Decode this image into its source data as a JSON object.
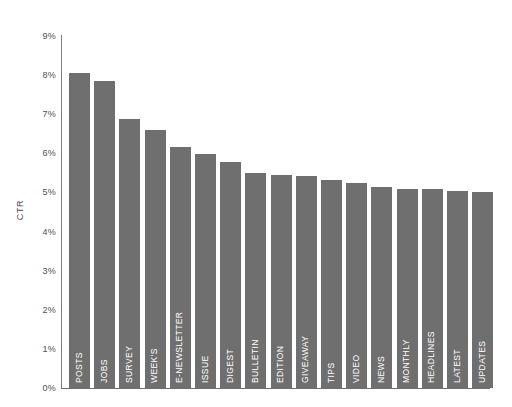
{
  "chart_data": {
    "type": "bar",
    "title": "",
    "subtitle": "",
    "xlabel": "",
    "ylabel": "CTR",
    "ylim": [
      0,
      9
    ],
    "grid": false,
    "legend": false,
    "legend_position": "none",
    "y_tick_labels": [
      "9%",
      "8%",
      "7%",
      "6%",
      "5%",
      "4%",
      "3%",
      "2%",
      "1%",
      "0%"
    ],
    "y_tick_values": [
      9,
      8,
      7,
      6,
      5,
      4,
      3,
      2,
      1,
      0
    ],
    "value_suffix": "%",
    "bar_color": "#706F6F",
    "axis_color": "#7D7D7D",
    "background_color": "#FFFFFF",
    "label_color": "#FFFFFF",
    "categories": [
      "POSTS",
      "JOBS",
      "SURVEY",
      "WEEK'S",
      "E-NEWSLETTER",
      "ISSUE",
      "DIGEST",
      "BULLETIN",
      "EDITION",
      "GIVEAWAY",
      "TIPS",
      "VIDEO",
      "NEWS",
      "MONTHLY",
      "HEADLINES",
      "LATEST",
      "UPDATES"
    ],
    "values": [
      8.05,
      7.85,
      6.88,
      6.6,
      6.15,
      5.98,
      5.78,
      5.5,
      5.45,
      5.42,
      5.32,
      5.25,
      5.15,
      5.1,
      5.08,
      5.05,
      5.02
    ]
  }
}
